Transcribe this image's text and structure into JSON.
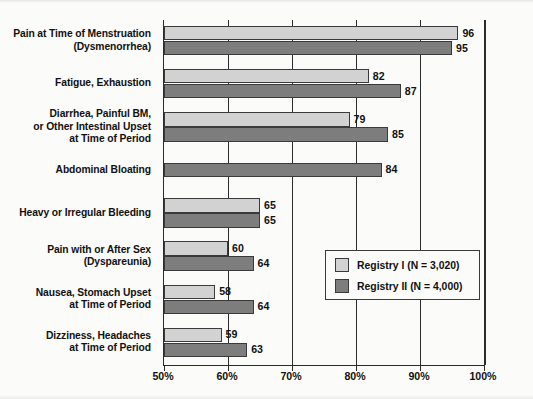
{
  "chart_data": {
    "type": "bar",
    "orientation": "horizontal",
    "title": "",
    "xlabel": "",
    "ylabel": "",
    "xlim": [
      50,
      100
    ],
    "xticks": [
      50,
      60,
      70,
      80,
      90,
      100
    ],
    "xticklabels": [
      "50%",
      "60%",
      "70%",
      "80%",
      "90%",
      "100%"
    ],
    "grid": true,
    "grid_axis": "x",
    "legend_position": "center-right",
    "categories": [
      "Pain at Time of Menstruation (Dysmenorrhea)",
      "Fatigue, Exhaustion",
      "Diarrhea, Painful BM, or Other Intestinal Upset at Time of Period",
      "Abdominal Bloating",
      "Heavy or Irregular Bleeding",
      "Pain with or After Sex (Dyspareunia)",
      "Nausea, Stomach Upset at Time of Period",
      "Dizziness, Headaches at Time of Period"
    ],
    "category_lines": [
      [
        "Pain at Time of Menstruation",
        "(Dysmenorrhea)"
      ],
      [
        "Fatigue, Exhaustion"
      ],
      [
        "Diarrhea, Painful BM,",
        "or Other Intestinal Upset",
        "at Time of Period"
      ],
      [
        "Abdominal Bloating"
      ],
      [
        "Heavy or Irregular Bleeding"
      ],
      [
        "Pain with or After Sex",
        "(Dyspareunia)"
      ],
      [
        "Nausea, Stomach Upset",
        "at Time of Period"
      ],
      [
        "Dizziness, Headaches",
        "at Time of Period"
      ]
    ],
    "series": [
      {
        "name": "Registry I (N = 3,020)",
        "color": "#d2d2d2",
        "values": [
          96,
          82,
          79,
          null,
          65,
          60,
          58,
          59
        ]
      },
      {
        "name": "Registry II (N = 4,000)",
        "color": "#7d7d7d",
        "values": [
          95,
          87,
          85,
          84,
          65,
          64,
          64,
          63
        ]
      }
    ]
  },
  "legend": {
    "entries": [
      {
        "label": "Registry I (N = 3,020)",
        "swatch": "#d2d2d2"
      },
      {
        "label": "Registry II (N = 4,000)",
        "swatch": "#7d7d7d"
      }
    ]
  },
  "axis": {
    "x_tick_labels": [
      "50%",
      "60%",
      "70%",
      "80%",
      "90%",
      "100%"
    ]
  }
}
